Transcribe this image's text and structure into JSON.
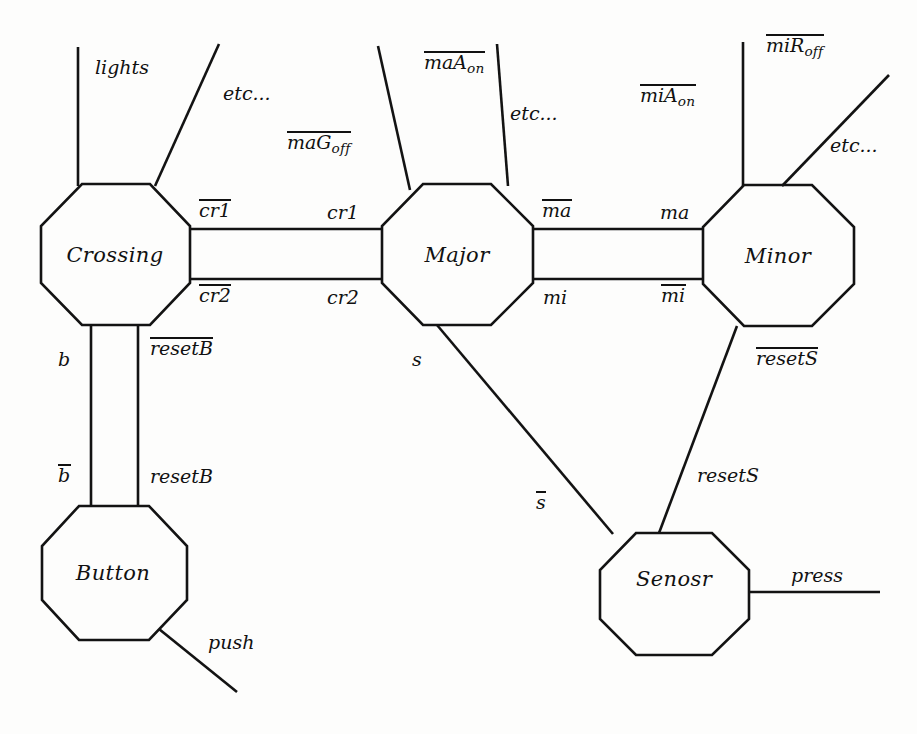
{
  "diagram": {
    "stroke_color": "#131313",
    "background_color": "#fdfdfc",
    "nodes": [
      {
        "id": "crossing",
        "label": "Crossing",
        "cx": 115,
        "cy": 255
      },
      {
        "id": "major",
        "label": "Major",
        "cx": 457,
        "cy": 255
      },
      {
        "id": "minor",
        "label": "Minor",
        "cx": 778,
        "cy": 256
      },
      {
        "id": "button",
        "label": "Button",
        "cx": 113,
        "cy": 573
      },
      {
        "id": "sensor",
        "label": "Senosr",
        "cx": 674,
        "cy": 579
      }
    ],
    "port_labels": [
      {
        "id": "lights",
        "text": "lights",
        "overline": false,
        "sub": "",
        "x": 95,
        "y": 58,
        "align": "left"
      },
      {
        "id": "etc-crossing",
        "text": "etc...",
        "overline": false,
        "sub": "",
        "x": 223,
        "y": 84,
        "align": "left"
      },
      {
        "id": "maG-off",
        "text": "maG",
        "overline": true,
        "sub": "off",
        "x": 287,
        "y": 132,
        "align": "left"
      },
      {
        "id": "maA-on",
        "text": "maA",
        "overline": true,
        "sub": "on",
        "x": 424,
        "y": 52,
        "align": "left"
      },
      {
        "id": "etc-major",
        "text": "etc...",
        "overline": false,
        "sub": "",
        "x": 510,
        "y": 104,
        "align": "left"
      },
      {
        "id": "miA-on",
        "text": "miA",
        "overline": true,
        "sub": "on",
        "x": 640,
        "y": 85,
        "align": "left"
      },
      {
        "id": "miR-off",
        "text": "miR",
        "overline": true,
        "sub": "off",
        "x": 766,
        "y": 35,
        "align": "left"
      },
      {
        "id": "etc-minor",
        "text": "etc...",
        "overline": false,
        "sub": "",
        "x": 830,
        "y": 136,
        "align": "left"
      },
      {
        "id": "cr1-bar",
        "text": "cr1",
        "overline": true,
        "sub": "",
        "x": 199,
        "y": 200,
        "align": "left"
      },
      {
        "id": "cr1",
        "text": "cr1",
        "overline": false,
        "sub": "",
        "x": 327,
        "y": 203,
        "align": "left"
      },
      {
        "id": "cr2-bar",
        "text": "cr2",
        "overline": true,
        "sub": "",
        "x": 199,
        "y": 285,
        "align": "left"
      },
      {
        "id": "cr2",
        "text": "cr2",
        "overline": false,
        "sub": "",
        "x": 327,
        "y": 288,
        "align": "left"
      },
      {
        "id": "ma-bar",
        "text": "ma",
        "overline": true,
        "sub": "",
        "x": 542,
        "y": 200,
        "align": "left"
      },
      {
        "id": "ma",
        "text": "ma",
        "overline": false,
        "sub": "",
        "x": 660,
        "y": 203,
        "align": "left"
      },
      {
        "id": "mi",
        "text": "mi",
        "overline": false,
        "sub": "",
        "x": 543,
        "y": 288,
        "align": "left"
      },
      {
        "id": "mi-bar",
        "text": "mi",
        "overline": true,
        "sub": "",
        "x": 661,
        "y": 285,
        "align": "left"
      },
      {
        "id": "b",
        "text": "b",
        "overline": false,
        "sub": "",
        "x": 58,
        "y": 350,
        "align": "left"
      },
      {
        "id": "resetB-bar",
        "text": "resetB",
        "overline": true,
        "sub": "",
        "x": 150,
        "y": 338,
        "align": "left"
      },
      {
        "id": "b-bar",
        "text": "b",
        "overline": true,
        "sub": "",
        "x": 58,
        "y": 465,
        "align": "left"
      },
      {
        "id": "resetB",
        "text": "resetB",
        "overline": false,
        "sub": "",
        "x": 150,
        "y": 467,
        "align": "left"
      },
      {
        "id": "s",
        "text": "s",
        "overline": false,
        "sub": "",
        "x": 412,
        "y": 350,
        "align": "left"
      },
      {
        "id": "s-bar",
        "text": "s",
        "overline": true,
        "sub": "",
        "x": 536,
        "y": 492,
        "align": "left"
      },
      {
        "id": "resetS-bar",
        "text": "resetS",
        "overline": true,
        "sub": "",
        "x": 756,
        "y": 348,
        "align": "left"
      },
      {
        "id": "resetS",
        "text": "resetS",
        "overline": false,
        "sub": "",
        "x": 697,
        "y": 466,
        "align": "left"
      },
      {
        "id": "push",
        "text": "push",
        "overline": false,
        "sub": "",
        "x": 208,
        "y": 633,
        "align": "left"
      },
      {
        "id": "press",
        "text": "press",
        "overline": false,
        "sub": "",
        "x": 791,
        "y": 566,
        "align": "left"
      }
    ],
    "channels": [
      {
        "id": "crossing-major-cr1",
        "from": "crossing",
        "to": "major",
        "labels": [
          "cr1-bar",
          "cr1"
        ]
      },
      {
        "id": "crossing-major-cr2",
        "from": "crossing",
        "to": "major",
        "labels": [
          "cr2-bar",
          "cr2"
        ]
      },
      {
        "id": "major-minor-ma",
        "from": "major",
        "to": "minor",
        "labels": [
          "ma-bar",
          "ma"
        ]
      },
      {
        "id": "major-minor-mi",
        "from": "major",
        "to": "minor",
        "labels": [
          "mi",
          "mi-bar"
        ]
      },
      {
        "id": "crossing-button",
        "from": "crossing",
        "to": "button",
        "labels": [
          "b",
          "b-bar",
          "resetB-bar",
          "resetB"
        ]
      },
      {
        "id": "major-sensor",
        "from": "major",
        "to": "sensor",
        "labels": [
          "s",
          "s-bar"
        ]
      },
      {
        "id": "minor-sensor",
        "from": "minor",
        "to": "sensor",
        "labels": [
          "resetS-bar",
          "resetS"
        ]
      }
    ],
    "external_wires": [
      {
        "id": "wire-lights",
        "label": "lights"
      },
      {
        "id": "wire-etc-crossing",
        "label": "etc..."
      },
      {
        "id": "wire-maG-off",
        "label": "maG_off"
      },
      {
        "id": "wire-maA-on",
        "label": "maA_on"
      },
      {
        "id": "wire-etc-major",
        "label": "etc..."
      },
      {
        "id": "wire-miA-on",
        "label": "miA_on"
      },
      {
        "id": "wire-miR-off",
        "label": "miR_off"
      },
      {
        "id": "wire-etc-minor",
        "label": "etc..."
      },
      {
        "id": "wire-push",
        "label": "push"
      },
      {
        "id": "wire-press",
        "label": "press"
      }
    ]
  }
}
